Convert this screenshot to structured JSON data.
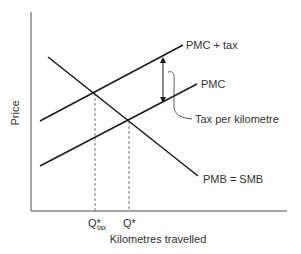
{
  "diagram": {
    "type": "economics-supply-demand-externality",
    "axes": {
      "y_label": "Price",
      "x_label": "Kilometres travelled",
      "color": "#888888"
    },
    "curves": [
      {
        "id": "pmc_tax",
        "label": "PMC + tax",
        "x1": 40,
        "y1": 121,
        "x2": 183,
        "y2": 45
      },
      {
        "id": "pmc",
        "label": "PMC",
        "x1": 40,
        "y1": 166,
        "x2": 197,
        "y2": 84
      },
      {
        "id": "pmb",
        "label": "PMB = SMB",
        "x1": 48,
        "y1": 57,
        "x2": 198,
        "y2": 176
      }
    ],
    "annotation": {
      "label": "Tax per kilometre",
      "arrow_x": 163,
      "arrow_y_top": 57,
      "arrow_y_bottom": 104
    },
    "quantities": {
      "q_tax": {
        "main": "Q*",
        "sub": "tax",
        "x": 95,
        "y_intersect": 93
      },
      "q_star": {
        "main": "Q*",
        "x": 129,
        "y_intersect": 121
      }
    },
    "line_color": "#1a1a1a",
    "text_color": "#333333"
  }
}
